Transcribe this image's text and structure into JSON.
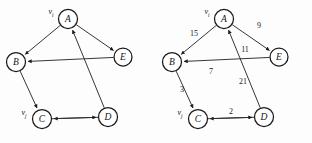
{
  "figure": {
    "title": "",
    "panels": [
      {
        "id": "left-panel",
        "name": "unweighted-directed-graph",
        "show_weights": false,
        "origin_x": 0,
        "nodes": [
          {
            "id": "A",
            "label": "A",
            "cx": 68,
            "cy": 19,
            "r": 9.5
          },
          {
            "id": "B",
            "label": "B",
            "cx": 16,
            "cy": 62,
            "r": 9.5
          },
          {
            "id": "E",
            "label": "E",
            "cx": 123,
            "cy": 57,
            "r": 9.0
          },
          {
            "id": "C",
            "label": "C",
            "cx": 42,
            "cy": 119,
            "r": 9.5
          },
          {
            "id": "D",
            "label": "D",
            "cx": 108,
            "cy": 117,
            "r": 9.5
          }
        ],
        "tags": [
          {
            "for": "A",
            "base": "v",
            "sub": "i",
            "x": 51,
            "y": 12
          },
          {
            "for": "C",
            "base": "v",
            "sub": "j",
            "x": 24,
            "y": 113
          }
        ],
        "edges": [
          {
            "from": "A",
            "to": "B",
            "weight": "15",
            "wx": 40,
            "wy": 36
          },
          {
            "from": "A",
            "to": "E",
            "weight": "9",
            "wx": 100,
            "wy": 31
          },
          {
            "from": "D",
            "to": "A",
            "weight": "11",
            "wx": 86,
            "wy": 62
          },
          {
            "from": "E",
            "to": "B",
            "weight": "21",
            "wx": 82,
            "wy": 84
          },
          {
            "from": "B",
            "to": "C",
            "weight": "3",
            "wx": 25,
            "wy": 94
          },
          {
            "from": "D",
            "to": "C",
            "weight": "7",
            "wx": 56,
            "wy": 74
          },
          {
            "from": "C",
            "to": "D",
            "weight": "2",
            "wx": 75,
            "wy": 114
          }
        ]
      },
      {
        "id": "right-panel",
        "name": "weighted-directed-graph",
        "show_weights": true,
        "origin_x": 156,
        "nodes": [
          {
            "id": "A",
            "label": "A",
            "cx": 68,
            "cy": 19,
            "r": 9.5
          },
          {
            "id": "B",
            "label": "B",
            "cx": 16,
            "cy": 62,
            "r": 9.5
          },
          {
            "id": "E",
            "label": "E",
            "cx": 123,
            "cy": 57,
            "r": 9.0
          },
          {
            "id": "C",
            "label": "C",
            "cx": 42,
            "cy": 119,
            "r": 9.5
          },
          {
            "id": "D",
            "label": "D",
            "cx": 108,
            "cy": 117,
            "r": 9.5
          }
        ],
        "tags": [
          {
            "for": "A",
            "base": "v",
            "sub": "i",
            "x": 51,
            "y": 12
          },
          {
            "for": "C",
            "base": "v",
            "sub": "j",
            "x": 24,
            "y": 113
          }
        ],
        "edges": [
          {
            "from": "A",
            "to": "B",
            "weight": "15",
            "wx": 38,
            "wy": 34
          },
          {
            "from": "A",
            "to": "E",
            "weight": "9",
            "wx": 103,
            "wy": 26
          },
          {
            "from": "D",
            "to": "A",
            "weight": "11",
            "wx": 89,
            "wy": 50
          },
          {
            "from": "E",
            "to": "B",
            "weight": "21",
            "wx": 87,
            "wy": 82
          },
          {
            "from": "B",
            "to": "C",
            "weight": "3",
            "wx": 26,
            "wy": 90
          },
          {
            "from": "D",
            "to": "C",
            "weight": "7",
            "wx": 55,
            "wy": 72
          },
          {
            "from": "C",
            "to": "D",
            "weight": "2",
            "wx": 75,
            "wy": 112
          }
        ]
      }
    ]
  },
  "chart_data": {
    "type": "diagram",
    "subtype": "directed-graph-pair",
    "title": "",
    "vertices": [
      "A",
      "B",
      "C",
      "D",
      "E"
    ],
    "vertex_tags": {
      "A": "v_i",
      "C": "v_j"
    },
    "directed_edges": [
      {
        "source": "A",
        "target": "B",
        "weight": 15
      },
      {
        "source": "A",
        "target": "E",
        "weight": 9
      },
      {
        "source": "D",
        "target": "A",
        "weight": 11
      },
      {
        "source": "E",
        "target": "B",
        "weight": 21
      },
      {
        "source": "B",
        "target": "C",
        "weight": 3
      },
      {
        "source": "D",
        "target": "C",
        "weight": 7
      },
      {
        "source": "C",
        "target": "D",
        "weight": 2
      }
    ],
    "weights_shown_on": "right-panel",
    "legend": [],
    "xlabel": "",
    "ylabel": ""
  }
}
